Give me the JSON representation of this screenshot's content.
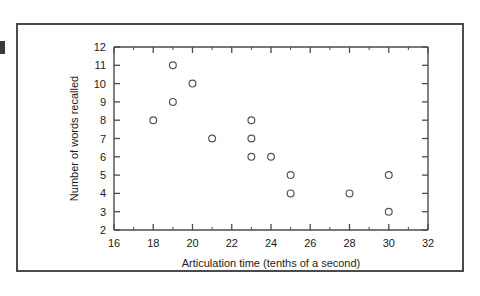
{
  "figure": {
    "frame_color": "#4a4a50",
    "background_color": "#ffffff",
    "marker_color": "#55555c",
    "text_color": "#1c1c20"
  },
  "chart_data": {
    "type": "scatter",
    "title": "",
    "xlabel": "Articulation time (tenths of a second)",
    "ylabel": "Number of words recalled",
    "xlim": [
      16,
      32
    ],
    "ylim": [
      2,
      12
    ],
    "xticks": [
      16,
      18,
      20,
      22,
      24,
      26,
      28,
      30,
      32
    ],
    "xtick_labels": [
      "16",
      "18",
      "20",
      "22",
      "24",
      "26",
      "28",
      "30",
      "32"
    ],
    "x_minor_ticks": [
      17,
      19,
      21,
      23,
      25,
      27,
      29,
      31
    ],
    "yticks": [
      2,
      3,
      4,
      5,
      6,
      7,
      8,
      9,
      10,
      11,
      12
    ],
    "ytick_labels": [
      "2",
      "3",
      "4",
      "5",
      "6",
      "7",
      "8",
      "9",
      "10",
      "11",
      "12"
    ],
    "grid": false,
    "legend": null,
    "marker": "open-circle",
    "points": [
      {
        "x": 18,
        "y": 8
      },
      {
        "x": 19,
        "y": 11
      },
      {
        "x": 19,
        "y": 9
      },
      {
        "x": 20,
        "y": 10
      },
      {
        "x": 21,
        "y": 7
      },
      {
        "x": 23,
        "y": 8
      },
      {
        "x": 23,
        "y": 7
      },
      {
        "x": 23,
        "y": 6
      },
      {
        "x": 24,
        "y": 6
      },
      {
        "x": 25,
        "y": 5
      },
      {
        "x": 25,
        "y": 4
      },
      {
        "x": 28,
        "y": 4
      },
      {
        "x": 30,
        "y": 5
      },
      {
        "x": 30,
        "y": 3
      }
    ]
  }
}
